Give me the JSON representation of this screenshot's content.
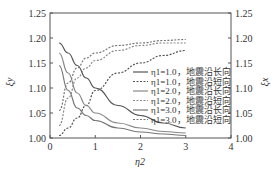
{
  "chart_data": {
    "type": "line",
    "title": "",
    "xlabel": "η2",
    "ylabel_left": "ξy",
    "ylabel_right": "ξx",
    "xlim": [
      0,
      4
    ],
    "ylim": [
      1.0,
      1.25
    ],
    "xticks": [
      "0",
      "1",
      "2",
      "3",
      "4"
    ],
    "yticks": [
      "1.00",
      "1.05",
      "1.10",
      "1.15",
      "1.20",
      "1.25"
    ],
    "grid": false,
    "legend_position": "center-right",
    "x": [
      0.2,
      0.4,
      0.6,
      0.8,
      1.0,
      1.5,
      2.0,
      2.5,
      3.0
    ],
    "series": [
      {
        "name": "η1=1.0，地震沿长向",
        "style": "solid",
        "color": "#555555",
        "values": [
          1.19,
          1.17,
          1.145,
          1.12,
          1.1,
          1.065,
          1.045,
          1.03,
          1.02
        ]
      },
      {
        "name": "η1=1.0，地震沿短向",
        "style": "dashed",
        "color": "#555555",
        "values": [
          1.005,
          1.02,
          1.04,
          1.065,
          1.095,
          1.13,
          1.15,
          1.165,
          1.175
        ]
      },
      {
        "name": "η1=2.0，地震沿长向",
        "style": "solid",
        "color": "#888888",
        "values": [
          1.17,
          1.13,
          1.09,
          1.065,
          1.05,
          1.03,
          1.02,
          1.013,
          1.01
        ]
      },
      {
        "name": "η1=2.0，地震沿短向",
        "style": "dashed",
        "color": "#888888",
        "values": [
          1.025,
          1.08,
          1.12,
          1.14,
          1.155,
          1.175,
          1.185,
          1.19,
          1.19
        ]
      },
      {
        "name": "η1=3.0，地震沿长向",
        "style": "solid",
        "color": "#777777",
        "values": [
          1.145,
          1.095,
          1.06,
          1.045,
          1.035,
          1.02,
          1.012,
          1.008,
          1.005
        ]
      },
      {
        "name": "η1=3.0，地震沿短向",
        "style": "dashed",
        "color": "#777777",
        "values": [
          1.055,
          1.11,
          1.14,
          1.16,
          1.17,
          1.185,
          1.19,
          1.195,
          1.197
        ]
      }
    ]
  }
}
